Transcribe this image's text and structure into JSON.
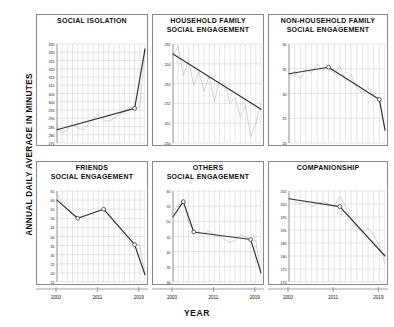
{
  "figure": {
    "ylabel": "ANNUAL DAILY AVERAGE IN MINUTES",
    "xlabel": "YEAR"
  },
  "chart_data": [
    {
      "type": "line",
      "title": "SOCIAL ISOLATION",
      "panel": 1,
      "xlabel": "YEAR",
      "ylabel": "ANNUAL DAILY AVERAGE IN MINUTES",
      "xlim": [
        2003,
        2020
      ],
      "ylim": [
        275,
        335
      ],
      "xticks": [
        2003,
        2011,
        2019
      ],
      "yticks": [
        275,
        280,
        285,
        290,
        295,
        300,
        305,
        310,
        315,
        320,
        325,
        330,
        335
      ],
      "grid": true,
      "legend": "none",
      "series": [
        {
          "name": "observed",
          "style": "thin-gray",
          "x": [
            2003,
            2004,
            2005,
            2006,
            2007,
            2008,
            2009,
            2010,
            2011,
            2012,
            2013,
            2014,
            2015,
            2016,
            2017,
            2018,
            2019,
            2020
          ],
          "values": [
            285,
            281,
            283,
            287,
            284,
            283,
            286,
            290,
            292,
            289,
            288,
            290,
            292,
            294,
            297,
            296,
            297,
            332
          ]
        },
        {
          "name": "piecewise-trend",
          "style": "thick-dark-with-markers",
          "x": [
            2003,
            2018,
            2020
          ],
          "values": [
            283,
            296,
            332
          ],
          "markers": [
            {
              "x": 2018,
              "y": 296
            }
          ]
        }
      ]
    },
    {
      "type": "line",
      "title": "HOUSEHOLD FAMILY\nSOCIAL ENGAGEMENT",
      "panel": 2,
      "xlabel": "YEAR",
      "ylabel": "ANNUAL DAILY AVERAGE IN MINUTES",
      "xlim": [
        2003,
        2020
      ],
      "ylim": [
        250,
        255
      ],
      "xticks": [
        2003,
        2011,
        2019
      ],
      "yticks": [
        250,
        251,
        252,
        253,
        254,
        255
      ],
      "grid": true,
      "legend": "none",
      "series": [
        {
          "name": "observed",
          "style": "thin-gray",
          "x": [
            2003,
            2004,
            2005,
            2006,
            2007,
            2008,
            2009,
            2010,
            2011,
            2012,
            2013,
            2014,
            2015,
            2016,
            2017,
            2018,
            2019,
            2020
          ],
          "values": [
            254.4,
            254.9,
            253.4,
            254.2,
            252.9,
            253.6,
            252.6,
            253.4,
            252.1,
            253.2,
            253.0,
            252.0,
            252.3,
            251.3,
            251.9,
            250.3,
            251.0,
            252.0
          ]
        },
        {
          "name": "linear-trend",
          "style": "thick-dark",
          "x": [
            2003,
            2020
          ],
          "values": [
            254.5,
            251.7
          ],
          "markers": []
        }
      ]
    },
    {
      "type": "line",
      "title": "NON-HOUSEHOLD FAMILY\nSOCIAL ENGAGEMENT",
      "panel": 3,
      "xlabel": "YEAR",
      "ylabel": "ANNUAL DAILY AVERAGE IN MINUTES",
      "xlim": [
        2003,
        2020
      ],
      "ylim": [
        20,
        40
      ],
      "xticks": [
        2003,
        2011,
        2019
      ],
      "yticks": [
        20,
        25,
        30,
        35,
        40
      ],
      "grid": true,
      "legend": "none",
      "series": [
        {
          "name": "observed",
          "style": "thin-gray",
          "x": [
            2003,
            2004,
            2005,
            2006,
            2007,
            2008,
            2009,
            2010,
            2011,
            2012,
            2013,
            2014,
            2015,
            2016,
            2017,
            2018,
            2019,
            2020
          ],
          "values": [
            33.4,
            34.6,
            33.0,
            35.0,
            34.2,
            36.0,
            34.6,
            35.8,
            34.0,
            35.6,
            32.6,
            33.8,
            31.2,
            30.0,
            31.2,
            29.4,
            29.0,
            22.6
          ]
        },
        {
          "name": "piecewise-trend",
          "style": "thick-dark-with-markers",
          "x": [
            2003,
            2010,
            2019,
            2020
          ],
          "values": [
            34.0,
            35.3,
            28.8,
            22.6
          ],
          "markers": [
            {
              "x": 2010,
              "y": 35.3
            },
            {
              "x": 2019,
              "y": 28.8
            }
          ]
        }
      ]
    },
    {
      "type": "line",
      "title": "FRIENDS\nSOCIAL ENGAGEMENT",
      "panel": 4,
      "xlabel": "YEAR",
      "ylabel": "ANNUAL DAILY AVERAGE IN MINUTES",
      "xlim": [
        2003,
        2020
      ],
      "ylim": [
        15,
        65
      ],
      "xticks": [
        2003,
        2011,
        2019
      ],
      "yticks": [
        15,
        20,
        25,
        30,
        35,
        40,
        45,
        50,
        55,
        60,
        65
      ],
      "grid": true,
      "legend": "none",
      "series": [
        {
          "name": "observed",
          "style": "thin-gray",
          "x": [
            2003,
            2004,
            2005,
            2006,
            2007,
            2008,
            2009,
            2010,
            2011,
            2012,
            2013,
            2014,
            2015,
            2016,
            2017,
            2018,
            2019,
            2020
          ],
          "values": [
            64,
            58,
            55,
            52,
            50,
            51,
            52,
            53,
            54,
            55,
            53,
            48,
            45,
            42,
            39,
            36,
            35,
            19
          ]
        },
        {
          "name": "piecewise-trend",
          "style": "thick-dark-with-markers",
          "x": [
            2003,
            2007,
            2012,
            2018,
            2020
          ],
          "values": [
            60,
            50,
            55,
            35.5,
            19
          ],
          "markers": [
            {
              "x": 2007,
              "y": 50
            },
            {
              "x": 2012,
              "y": 55
            },
            {
              "x": 2018,
              "y": 35.5
            }
          ]
        }
      ]
    },
    {
      "type": "line",
      "title": "OTHERS\nSOCIAL ENGAGEMENT",
      "panel": 5,
      "xlabel": "YEAR",
      "ylabel": "ANNUAL DAILY AVERAGE IN MINUTES",
      "xlim": [
        2003,
        2020
      ],
      "ylim": [
        30,
        60
      ],
      "xticks": [
        2003,
        2011,
        2019
      ],
      "yticks": [
        30,
        35,
        40,
        45,
        50,
        55,
        60
      ],
      "grid": true,
      "legend": "none",
      "series": [
        {
          "name": "observed",
          "style": "thin-gray",
          "x": [
            2003,
            2004,
            2005,
            2006,
            2007,
            2008,
            2009,
            2010,
            2011,
            2012,
            2013,
            2014,
            2015,
            2016,
            2017,
            2018,
            2019,
            2020
          ],
          "values": [
            53.5,
            55.0,
            56.5,
            50.0,
            46.5,
            46.0,
            45.8,
            47.0,
            45.5,
            45.0,
            44.0,
            43.0,
            43.8,
            45.5,
            44.8,
            44.0,
            43.5,
            33.0
          ]
        },
        {
          "name": "piecewise-trend",
          "style": "thick-dark-with-markers",
          "x": [
            2003,
            2005,
            2007,
            2018,
            2020
          ],
          "values": [
            51.5,
            56.5,
            46.5,
            44.0,
            33.0
          ],
          "markers": [
            {
              "x": 2005,
              "y": 56.5
            },
            {
              "x": 2007,
              "y": 46.5
            },
            {
              "x": 2018,
              "y": 44.0
            }
          ]
        }
      ]
    },
    {
      "type": "line",
      "title": "COMPANIONSHIP",
      "panel": 6,
      "xlabel": "YEAR",
      "ylabel": "ANNUAL DAILY AVERAGE IN MINUTES",
      "xlim": [
        2003,
        2020
      ],
      "ylim": [
        170,
        205
      ],
      "xticks": [
        2003,
        2011,
        2019
      ],
      "yticks": [
        170,
        175,
        180,
        185,
        190,
        195,
        200,
        205
      ],
      "grid": true,
      "legend": "none",
      "series": [
        {
          "name": "observed",
          "style": "thin-gray",
          "x": [
            2003,
            2004,
            2005,
            2006,
            2007,
            2008,
            2009,
            2010,
            2011,
            2012,
            2013,
            2014,
            2015,
            2016,
            2017,
            2018,
            2019,
            2020
          ],
          "values": [
            203,
            201,
            200,
            201,
            199,
            200,
            201,
            200,
            199,
            203,
            199,
            194,
            191,
            189,
            191,
            188,
            184,
            177
          ]
        },
        {
          "name": "piecewise-trend",
          "style": "thick-dark-with-markers",
          "x": [
            2003,
            2012,
            2020
          ],
          "values": [
            202,
            199,
            180
          ],
          "markers": [
            {
              "x": 2012,
              "y": 199
            }
          ]
        }
      ]
    }
  ],
  "colors": {
    "trend": "#333333",
    "observed": "#b9b9b9",
    "grid": "#cccccc",
    "frame": "#8a8a8a",
    "text": "#111111"
  }
}
